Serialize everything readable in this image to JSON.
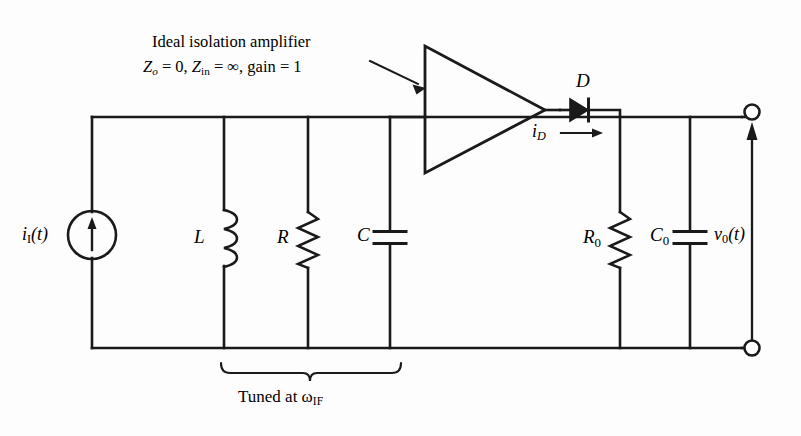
{
  "figure": {
    "kind": "circuit-schematic",
    "title_annotation": {
      "line1": "Ideal isolation amplifier",
      "line2_z_out_sym": "Z",
      "line2_z_out_sub": "o",
      "line2_eq1": " = 0, ",
      "line2_z_in_sym": "Z",
      "line2_z_in_sub": "in",
      "line2_eq2": " = ∞, gain = 1"
    },
    "background_color": "#fdfdfd",
    "line_color": "#1a1a1a"
  },
  "source": {
    "label_sym": "i",
    "label_sub": "I",
    "label_tail": "(t)",
    "name": "current-source",
    "arrow_direction": "up"
  },
  "tank": {
    "inductor": {
      "label": "L",
      "type": "inductor"
    },
    "resistor": {
      "label": "R",
      "type": "resistor"
    },
    "capacitor": {
      "label": "C",
      "type": "capacitor"
    },
    "brace_caption_head": "Tuned at ",
    "brace_caption_omega": "ω",
    "brace_caption_sub": "IF"
  },
  "amplifier": {
    "shape": "triangle",
    "gain": "1",
    "name": "isolation-amplifier"
  },
  "diode": {
    "label": "D",
    "current_sym": "i",
    "current_sub": "D",
    "direction": "right"
  },
  "output": {
    "resistor": {
      "label_sym": "R",
      "label_sub": "0",
      "type": "resistor"
    },
    "capacitor": {
      "label_sym": "C",
      "label_sub": "0",
      "type": "capacitor"
    },
    "voltage": {
      "label_sym": "v",
      "label_sub": "0",
      "label_tail": "(t)"
    },
    "terminal_top": "open-terminal",
    "terminal_bottom": "open-terminal"
  }
}
